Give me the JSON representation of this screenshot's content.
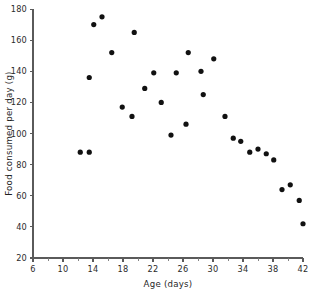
{
  "chart_data": {
    "type": "scatter",
    "title": "",
    "xlabel": "Age (days)",
    "ylabel": "Food consumed per day (g)",
    "xlim": [
      6,
      42
    ],
    "ylim": [
      20,
      180
    ],
    "grid": false,
    "legend": null,
    "x_ticks": [
      6,
      10,
      14,
      18,
      22,
      26,
      30,
      34,
      38,
      42
    ],
    "x_tick_labels": [
      "6",
      "10",
      "14",
      "18",
      "22",
      "26",
      "30",
      "34",
      "38",
      "42"
    ],
    "x_minor_ticks": [
      8,
      12,
      16,
      20,
      24,
      28,
      32,
      36,
      40
    ],
    "y_ticks": [
      20,
      40,
      60,
      80,
      100,
      120,
      140,
      160,
      180
    ],
    "y_tick_labels": [
      "20",
      "40",
      "60",
      "80",
      "100",
      "120",
      "140",
      "160",
      "180"
    ],
    "marker": "filled-circle",
    "marker_color": "#111111",
    "marker_size": 2.6,
    "points": [
      {
        "x": 12.3,
        "y": 88
      },
      {
        "x": 13.5,
        "y": 88
      },
      {
        "x": 13.5,
        "y": 136
      },
      {
        "x": 14.1,
        "y": 170
      },
      {
        "x": 15.2,
        "y": 175
      },
      {
        "x": 16.5,
        "y": 152
      },
      {
        "x": 17.9,
        "y": 117
      },
      {
        "x": 19.2,
        "y": 111
      },
      {
        "x": 19.5,
        "y": 165
      },
      {
        "x": 20.9,
        "y": 129
      },
      {
        "x": 22.1,
        "y": 139
      },
      {
        "x": 23.1,
        "y": 120
      },
      {
        "x": 24.4,
        "y": 99
      },
      {
        "x": 25.1,
        "y": 139
      },
      {
        "x": 26.4,
        "y": 106
      },
      {
        "x": 26.7,
        "y": 152
      },
      {
        "x": 28.4,
        "y": 140
      },
      {
        "x": 28.7,
        "y": 125
      },
      {
        "x": 30.1,
        "y": 148
      },
      {
        "x": 31.6,
        "y": 111
      },
      {
        "x": 32.7,
        "y": 97
      },
      {
        "x": 33.7,
        "y": 95
      },
      {
        "x": 34.9,
        "y": 88
      },
      {
        "x": 36.0,
        "y": 90
      },
      {
        "x": 37.1,
        "y": 87
      },
      {
        "x": 38.1,
        "y": 83
      },
      {
        "x": 39.2,
        "y": 64
      },
      {
        "x": 40.3,
        "y": 67
      },
      {
        "x": 41.5,
        "y": 57
      },
      {
        "x": 42.0,
        "y": 42
      }
    ]
  }
}
